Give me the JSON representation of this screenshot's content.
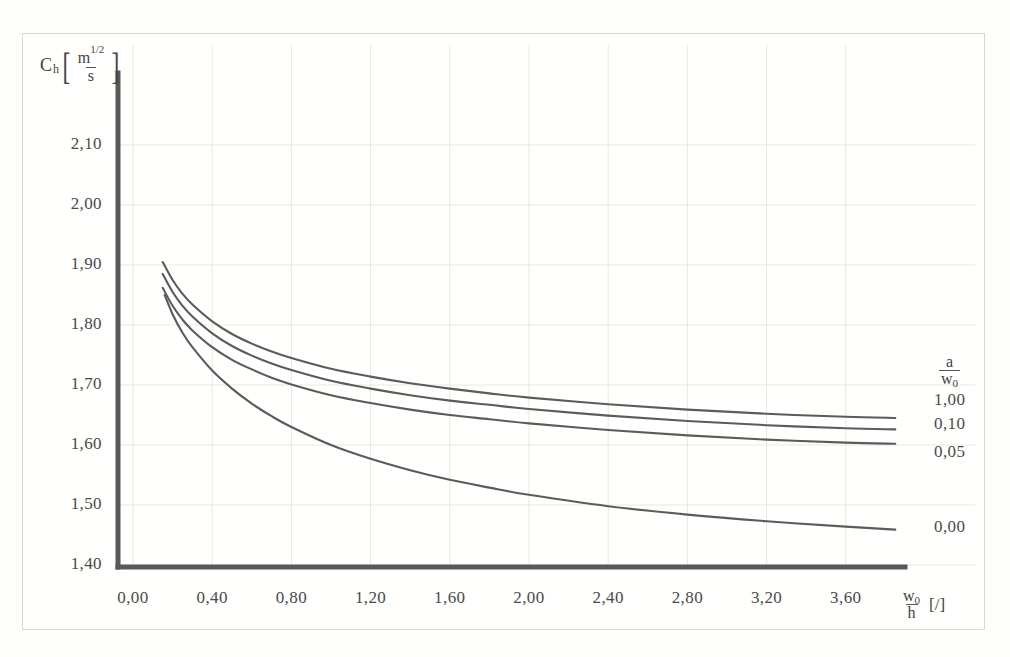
{
  "chart_data": {
    "type": "line",
    "title": "",
    "xlabel": "w0/h [/]",
    "ylabel": "Ch [m^(1/2)/s]",
    "xlim": [
      0.0,
      3.9
    ],
    "ylim": [
      1.4,
      2.15
    ],
    "grid": true,
    "legend_position": "right",
    "legend_title": "a / w0",
    "x_ticks": [
      "0,00",
      "0,40",
      "0,80",
      "1,20",
      "1,60",
      "2,00",
      "2,40",
      "2,80",
      "3,20",
      "3,60"
    ],
    "x_tick_values": [
      0.0,
      0.4,
      0.8,
      1.2,
      1.6,
      2.0,
      2.4,
      2.8,
      3.2,
      3.6
    ],
    "y_ticks": [
      "1,40",
      "1,50",
      "1,60",
      "1,70",
      "1,80",
      "1,90",
      "2,00",
      "2,10"
    ],
    "y_tick_values": [
      1.4,
      1.5,
      1.6,
      1.7,
      1.8,
      1.9,
      2.0,
      2.1
    ],
    "series": [
      {
        "name": "1,00",
        "label": "1,00",
        "x": [
          0.15,
          0.2,
          0.25,
          0.3,
          0.4,
          0.5,
          0.6,
          0.7,
          0.8,
          1.0,
          1.2,
          1.4,
          1.6,
          1.8,
          2.0,
          2.4,
          2.8,
          3.2,
          3.6,
          3.85
        ],
        "y": [
          1.905,
          1.875,
          1.852,
          1.834,
          1.806,
          1.785,
          1.769,
          1.756,
          1.745,
          1.727,
          1.714,
          1.703,
          1.694,
          1.686,
          1.679,
          1.668,
          1.659,
          1.652,
          1.647,
          1.645
        ]
      },
      {
        "name": "0,10",
        "label": "0,10",
        "x": [
          0.15,
          0.2,
          0.25,
          0.3,
          0.4,
          0.5,
          0.6,
          0.7,
          0.8,
          1.0,
          1.2,
          1.4,
          1.6,
          1.8,
          2.0,
          2.4,
          2.8,
          3.2,
          3.6,
          3.85
        ],
        "y": [
          1.885,
          1.855,
          1.832,
          1.814,
          1.786,
          1.765,
          1.749,
          1.736,
          1.725,
          1.707,
          1.694,
          1.683,
          1.674,
          1.667,
          1.66,
          1.649,
          1.64,
          1.633,
          1.628,
          1.626
        ]
      },
      {
        "name": "0,05",
        "label": "0,05",
        "x": [
          0.15,
          0.2,
          0.25,
          0.3,
          0.4,
          0.5,
          0.6,
          0.7,
          0.8,
          1.0,
          1.2,
          1.4,
          1.6,
          1.8,
          2.0,
          2.4,
          2.8,
          3.2,
          3.6,
          3.85
        ],
        "y": [
          1.862,
          1.832,
          1.809,
          1.791,
          1.763,
          1.742,
          1.726,
          1.712,
          1.701,
          1.683,
          1.67,
          1.659,
          1.65,
          1.643,
          1.636,
          1.625,
          1.616,
          1.609,
          1.604,
          1.602
        ]
      },
      {
        "name": "0,00",
        "label": "0,00",
        "x": [
          0.16,
          0.2,
          0.25,
          0.3,
          0.4,
          0.5,
          0.6,
          0.7,
          0.8,
          1.0,
          1.2,
          1.4,
          1.6,
          1.8,
          2.0,
          2.4,
          2.8,
          3.2,
          3.6,
          3.85
        ],
        "y": [
          1.85,
          1.818,
          1.787,
          1.763,
          1.724,
          1.694,
          1.669,
          1.648,
          1.63,
          1.6,
          1.577,
          1.558,
          1.542,
          1.529,
          1.517,
          1.498,
          1.484,
          1.473,
          1.464,
          1.459
        ]
      }
    ]
  },
  "axes": {
    "y_axis_label_symbol": "C",
    "y_axis_label_subscript": "h",
    "y_axis_unit_numerator": "m",
    "y_axis_unit_numerator_sup": "1/2",
    "y_axis_unit_denominator": "s",
    "x_axis_label_numerator": "w",
    "x_axis_label_numerator_sub": "0",
    "x_axis_label_denominator": "h",
    "x_axis_units": "[/]"
  },
  "legend": {
    "title_numerator": "a",
    "title_denominator": "w",
    "title_denominator_sub": "0",
    "items": [
      {
        "label": "1,00"
      },
      {
        "label": "0,10"
      },
      {
        "label": "0,05"
      },
      {
        "label": "0,00"
      }
    ]
  },
  "colors": {
    "curve": "#5b5b5b",
    "axis": "#595959",
    "grid": "#e9e7e3",
    "text": "#4a4a4a",
    "background": "#fdfdfc"
  }
}
